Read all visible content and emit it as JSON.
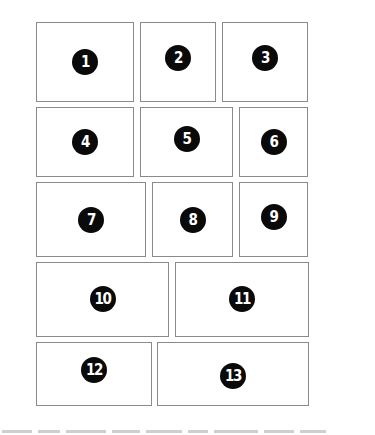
{
  "diagram": {
    "type": "comic-page-panel-layout",
    "border_color": "#8a8a8a",
    "badge_color": "#0a0a0a",
    "panels": [
      {
        "label": "1",
        "x": 36,
        "y": 22,
        "w": 98,
        "h": 80
      },
      {
        "label": "2",
        "x": 140,
        "y": 22,
        "w": 76,
        "h": 80
      },
      {
        "label": "3",
        "x": 222,
        "y": 22,
        "w": 86,
        "h": 80
      },
      {
        "label": "4",
        "x": 36,
        "y": 107,
        "w": 98,
        "h": 70
      },
      {
        "label": "5",
        "x": 140,
        "y": 107,
        "w": 93,
        "h": 70
      },
      {
        "label": "6",
        "x": 239,
        "y": 107,
        "w": 69,
        "h": 70
      },
      {
        "label": "7",
        "x": 36,
        "y": 182,
        "w": 110,
        "h": 75
      },
      {
        "label": "8",
        "x": 152,
        "y": 182,
        "w": 81,
        "h": 75
      },
      {
        "label": "9",
        "x": 239,
        "y": 182,
        "w": 69,
        "h": 75
      },
      {
        "label": "10",
        "x": 36,
        "y": 262,
        "w": 133,
        "h": 75
      },
      {
        "label": "11",
        "x": 175,
        "y": 262,
        "w": 134,
        "h": 75
      },
      {
        "label": "12",
        "x": 36,
        "y": 342,
        "w": 116,
        "h": 64
      },
      {
        "label": "13",
        "x": 157,
        "y": 342,
        "w": 152,
        "h": 64
      }
    ],
    "badge_offsets": [
      {
        "dx": 0,
        "dy": 0
      },
      {
        "dx": 0,
        "dy": -4
      },
      {
        "dx": 0,
        "dy": -4
      },
      {
        "dx": 0,
        "dy": 0
      },
      {
        "dx": 0,
        "dy": -3
      },
      {
        "dx": 0,
        "dy": 0
      },
      {
        "dx": 0,
        "dy": 0
      },
      {
        "dx": 0,
        "dy": 0
      },
      {
        "dx": 0,
        "dy": -3
      },
      {
        "dx": 0,
        "dy": -1
      },
      {
        "dx": 0,
        "dy": -1
      },
      {
        "dx": 0,
        "dy": -4
      },
      {
        "dx": 0,
        "dy": 2
      }
    ]
  }
}
